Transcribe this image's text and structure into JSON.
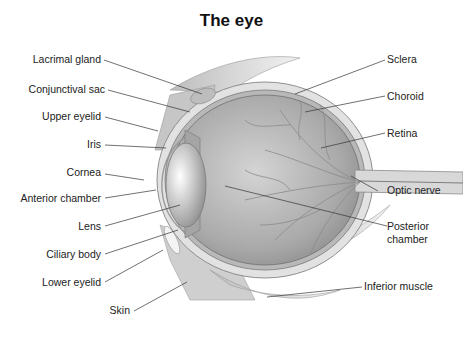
{
  "title": "The eye",
  "labels_left": [
    {
      "id": "lacrimal-gland",
      "text": "Lacrimal gland"
    },
    {
      "id": "conjunctival-sac",
      "text": "Conjunctival sac"
    },
    {
      "id": "upper-eyelid",
      "text": "Upper eyelid"
    },
    {
      "id": "iris",
      "text": "Iris"
    },
    {
      "id": "cornea",
      "text": "Cornea"
    },
    {
      "id": "anterior-chamber",
      "text": "Anterior chamber"
    },
    {
      "id": "lens",
      "text": "Lens"
    },
    {
      "id": "ciliary-body",
      "text": "Ciliary body"
    },
    {
      "id": "lower-eyelid",
      "text": "Lower eyelid"
    },
    {
      "id": "skin",
      "text": "Skin"
    }
  ],
  "labels_right": [
    {
      "id": "sclera",
      "text": "Sclera"
    },
    {
      "id": "choroid",
      "text": "Choroid"
    },
    {
      "id": "retina",
      "text": "Retina"
    },
    {
      "id": "optic-nerve",
      "text": "Optic nerve"
    },
    {
      "id": "posterior-chamber",
      "text": "Posterior chamber"
    },
    {
      "id": "inferior-muscle",
      "text": "Inferior muscle"
    }
  ]
}
